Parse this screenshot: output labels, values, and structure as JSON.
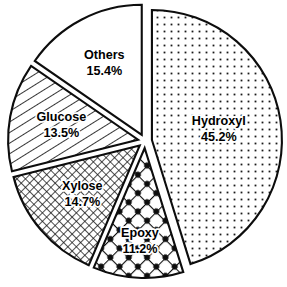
{
  "chart_data": {
    "type": "pie",
    "title": "",
    "subtitle": "",
    "xlabel": "",
    "ylabel": "",
    "legend_position": "none",
    "grid": false,
    "labels_on_slices": true,
    "value_unit": "%",
    "total": 100.0,
    "categories": [
      "Hydroxyl",
      "Others",
      "Glucose",
      "Xylose",
      "Epoxy"
    ],
    "values": [
      45.2,
      15.4,
      13.5,
      14.7,
      11.2
    ],
    "slices": [
      {
        "label": "Hydroxyl",
        "value": 45.2,
        "value_label": "45.2%",
        "fill_pattern": "fine-dots",
        "color": "#ffffff",
        "outline_color": "#0d0d0d",
        "start_angle_deg": 0.0,
        "end_angle_deg": 162.72,
        "exploded": true
      },
      {
        "label": "Epoxy",
        "value": 11.2,
        "value_label": "11.2%",
        "fill_pattern": "bold-crosshatch-dots",
        "color": "#ffffff",
        "outline_color": "#0d0d0d",
        "start_angle_deg": 162.72,
        "end_angle_deg": 203.04,
        "exploded": true
      },
      {
        "label": "Xylose",
        "value": 14.7,
        "value_label": "14.7%",
        "fill_pattern": "fine-crosshatch",
        "color": "#ffffff",
        "outline_color": "#0d0d0d",
        "start_angle_deg": 203.04,
        "end_angle_deg": 256.0,
        "exploded": true
      },
      {
        "label": "Glucose",
        "value": 13.5,
        "value_label": "13.5%",
        "fill_pattern": "diagonal-hatch",
        "color": "#ffffff",
        "outline_color": "#0d0d0d",
        "start_angle_deg": 256.0,
        "end_angle_deg": 304.6,
        "exploded": true
      },
      {
        "label": "Others",
        "value": 15.4,
        "value_label": "15.4%",
        "fill_pattern": "solid-white",
        "color": "#ffffff",
        "outline_color": "#0d0d0d",
        "start_angle_deg": 304.6,
        "end_angle_deg": 360.0,
        "exploded": true
      }
    ]
  },
  "figure": {
    "background_color": "#ffffff",
    "stroke_color": "#0d0d0d",
    "center_x": 145,
    "center_y": 141,
    "radius": 130
  },
  "labels": {
    "hydroxyl": {
      "name": "Hydroxyl",
      "value": "45.2%"
    },
    "others": {
      "name": "Others",
      "value": "15.4%"
    },
    "glucose": {
      "name": "Glucose",
      "value": "13.5%"
    },
    "xylose": {
      "name": "Xylose",
      "value": "14.7%"
    },
    "epoxy": {
      "name": "Epoxy",
      "value": "11.2%"
    }
  }
}
